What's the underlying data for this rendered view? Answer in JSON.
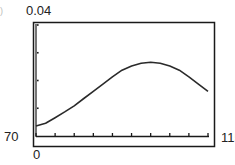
{
  "screen": {
    "labels": {
      "y_max": "0.04",
      "x_min": "70",
      "x_max": "115",
      "y_min": "0",
      "edge_fragment": ")"
    }
  },
  "chart_data": {
    "type": "line",
    "title": "",
    "xlabel": "",
    "ylabel": "",
    "xlim": [
      70,
      115
    ],
    "ylim": [
      0,
      0.04
    ],
    "x_tick_step": 5,
    "y_tick_step": 0.01,
    "x_tick_labels": [
      "70",
      "115"
    ],
    "y_tick_labels": [
      "0",
      "0.04"
    ],
    "grid": false,
    "legend": null,
    "series": [
      {
        "name": "normal pdf",
        "x": [
          70,
          72.5,
          75,
          77.5,
          80,
          82.5,
          85,
          87.5,
          90,
          92.5,
          95,
          97.5,
          100,
          102.5,
          105,
          107.5,
          110,
          112.5,
          115
        ],
        "values": [
          0.0036,
          0.0046,
          0.0066,
          0.0087,
          0.0109,
          0.0135,
          0.0161,
          0.0187,
          0.0213,
          0.0237,
          0.0252,
          0.0262,
          0.0266,
          0.0262,
          0.0252,
          0.0237,
          0.0213,
          0.0187,
          0.0161
        ]
      }
    ],
    "colors": {
      "curve": "#2a2a2a",
      "frame": "#1a1a1a",
      "background": "#ffffff"
    }
  }
}
